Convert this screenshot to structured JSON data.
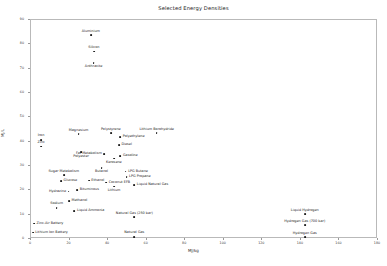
{
  "chart_data": {
    "type": "scatter",
    "title": "Selected Energy Densities",
    "xlabel": "MJ/kg",
    "ylabel": "MJ/L",
    "xlim": [
      0,
      180
    ],
    "ylim": [
      0,
      90
    ],
    "xticks": [
      "0",
      "20",
      "40",
      "60",
      "80",
      "100",
      "120",
      "140",
      "160",
      "180"
    ],
    "yticks": [
      "0",
      "10",
      "20",
      "30",
      "40",
      "50",
      "60",
      "70",
      "80",
      "90"
    ],
    "grid": false,
    "legend": "none",
    "marker_color": "#1a1a1a",
    "points": [
      {
        "label": "Aluminium",
        "x": 31.0,
        "y": 83.8,
        "pos": "above"
      },
      {
        "label": "Silicon",
        "x": 32.6,
        "y": 77.0,
        "pos": "above"
      },
      {
        "label": "Anthracite",
        "x": 32.5,
        "y": 72.4,
        "pos": "below"
      },
      {
        "label": "Magnesium",
        "x": 24.7,
        "y": 43.0,
        "pos": "above"
      },
      {
        "label": "Polystyrene",
        "x": 41.4,
        "y": 43.5,
        "pos": "above"
      },
      {
        "label": "Lithium Borohydride",
        "x": 65.2,
        "y": 43.4,
        "pos": "above"
      },
      {
        "label": "Polyethylene",
        "x": 46.3,
        "y": 42.0,
        "pos": "right"
      },
      {
        "label": "Iron",
        "x": 5.2,
        "y": 40.7,
        "pos": "above"
      },
      {
        "label": "Zinc",
        "x": 5.3,
        "y": 38.0,
        "pos": "above"
      },
      {
        "label": "Fat Metabolism",
        "x": 38.0,
        "y": 35.0,
        "pos": "left"
      },
      {
        "label": "Diesel",
        "x": 45.6,
        "y": 38.6,
        "pos": "right"
      },
      {
        "label": "Gasoline",
        "x": 46.4,
        "y": 34.2,
        "pos": "right"
      },
      {
        "label": "Polyester",
        "x": 26.0,
        "y": 35.6,
        "pos": "below"
      },
      {
        "label": "Kerosene",
        "x": 43.0,
        "y": 33.0,
        "pos": "below"
      },
      {
        "label": "Butanol",
        "x": 36.6,
        "y": 29.2,
        "pos": "below"
      },
      {
        "label": "Sugar Metabolism",
        "x": 17.0,
        "y": 26.2,
        "pos": "above"
      },
      {
        "label": "LPG Butane",
        "x": 49.1,
        "y": 27.7,
        "pos": "right"
      },
      {
        "label": "LPG Propane",
        "x": 49.6,
        "y": 25.3,
        "pos": "right"
      },
      {
        "label": "Coconut EFB",
        "x": 39.0,
        "y": 23.2,
        "pos": "right"
      },
      {
        "label": "Ethanol",
        "x": 30.0,
        "y": 24.0,
        "pos": "right"
      },
      {
        "label": "Glucose",
        "x": 15.6,
        "y": 23.9,
        "pos": "right"
      },
      {
        "label": "Lithium",
        "x": 43.1,
        "y": 21.5,
        "pos": "below"
      },
      {
        "label": "Liquid Natural Gas",
        "x": 53.6,
        "y": 22.2,
        "pos": "right"
      },
      {
        "label": "Bituminous",
        "x": 24.0,
        "y": 20.0,
        "pos": "right"
      },
      {
        "label": "Hydrazine",
        "x": 19.5,
        "y": 19.5,
        "pos": "left"
      },
      {
        "label": "Methanol",
        "x": 19.7,
        "y": 15.6,
        "pos": "right"
      },
      {
        "label": "Sodium",
        "x": 13.3,
        "y": 12.8,
        "pos": "above"
      },
      {
        "label": "Liquid Ammonia",
        "x": 22.5,
        "y": 11.5,
        "pos": "right"
      },
      {
        "label": "Natural Gas (250 bar)",
        "x": 53.6,
        "y": 9.0,
        "pos": "above"
      },
      {
        "label": "Liquid Hydrogen",
        "x": 142.0,
        "y": 10.1,
        "pos": "above"
      },
      {
        "label": "Hydrogen Gas (700 bar)",
        "x": 142.0,
        "y": 5.6,
        "pos": "above"
      },
      {
        "label": "Zinc-Air Battery",
        "x": 1.6,
        "y": 6.3,
        "pos": "right"
      },
      {
        "label": "Lithium Ion Battery",
        "x": 0.9,
        "y": 2.6,
        "pos": "right"
      },
      {
        "label": "Natural Gas",
        "x": 53.6,
        "y": 0.9,
        "pos": "above"
      },
      {
        "label": "Hydrogen Gas",
        "x": 142.0,
        "y": 0.8,
        "pos": "above"
      }
    ]
  }
}
